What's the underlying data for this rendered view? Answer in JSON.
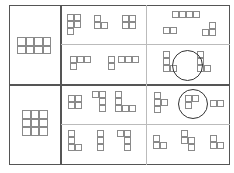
{
  "diagram": {
    "cell_size": 7,
    "colors": {
      "frame": "#555555",
      "divider": "#bbbbbb",
      "cell_border": "#8a8a8a",
      "circle": "#333333"
    },
    "rows": [
      {
        "reference": {
          "cols": 4,
          "rows": 2,
          "x": 17,
          "y": 37,
          "cell": 8.5
        },
        "groups": [
          {
            "name": "group-1a",
            "pieces": [
              {
                "x": 67,
                "y": 14,
                "cells": [
                  [
                    0,
                    0
                  ],
                  [
                    1,
                    0
                  ],
                  [
                    0,
                    1
                  ],
                  [
                    1,
                    1
                  ],
                  [
                    0,
                    2
                  ]
                ]
              },
              {
                "x": 94,
                "y": 15,
                "cells": [
                  [
                    0,
                    0
                  ],
                  [
                    0,
                    1
                  ],
                  [
                    1,
                    1
                  ]
                ]
              },
              {
                "x": 122,
                "y": 15,
                "cells": [
                  [
                    0,
                    0
                  ],
                  [
                    1,
                    0
                  ],
                  [
                    0,
                    1
                  ],
                  [
                    1,
                    1
                  ]
                ]
              }
            ]
          },
          {
            "name": "group-1b",
            "pieces": [
              {
                "x": 172,
                "y": 11,
                "cells": [
                  [
                    0,
                    0
                  ],
                  [
                    1,
                    0
                  ],
                  [
                    2,
                    0
                  ],
                  [
                    3,
                    0
                  ]
                ]
              },
              {
                "x": 163,
                "y": 27,
                "cells": [
                  [
                    0,
                    0
                  ],
                  [
                    1,
                    0
                  ]
                ]
              },
              {
                "x": 202,
                "y": 22,
                "cells": [
                  [
                    1,
                    0
                  ],
                  [
                    0,
                    1
                  ],
                  [
                    1,
                    1
                  ]
                ]
              }
            ]
          },
          {
            "name": "group-2a",
            "pieces": [
              {
                "x": 70,
                "y": 56,
                "cells": [
                  [
                    0,
                    0
                  ],
                  [
                    1,
                    0
                  ],
                  [
                    2,
                    0
                  ],
                  [
                    0,
                    1
                  ]
                ]
              },
              {
                "x": 108,
                "y": 56,
                "cells": [
                  [
                    0,
                    0
                  ],
                  [
                    0,
                    1
                  ]
                ]
              },
              {
                "x": 118,
                "y": 56,
                "cells": [
                  [
                    0,
                    0
                  ],
                  [
                    1,
                    0
                  ],
                  [
                    2,
                    0
                  ]
                ]
              }
            ]
          },
          {
            "name": "group-2b",
            "circled": true,
            "circle": {
              "x": 172,
              "y": 50,
              "d": 31
            },
            "pieces": [
              {
                "x": 163,
                "y": 51,
                "cells": [
                  [
                    0,
                    0
                  ],
                  [
                    0,
                    1
                  ],
                  [
                    0,
                    2
                  ],
                  [
                    1,
                    2
                  ]
                ]
              },
              {
                "x": 197,
                "y": 51,
                "cells": [
                  [
                    0,
                    0
                  ],
                  [
                    0,
                    1
                  ],
                  [
                    0,
                    2
                  ],
                  [
                    1,
                    2
                  ]
                ]
              }
            ]
          }
        ]
      },
      {
        "reference": {
          "cols": 3,
          "rows": 3,
          "x": 22,
          "y": 110,
          "cell": 8.5
        },
        "groups": [
          {
            "name": "group-3a",
            "pieces": [
              {
                "x": 68,
                "y": 95,
                "cells": [
                  [
                    0,
                    0
                  ],
                  [
                    1,
                    0
                  ],
                  [
                    0,
                    1
                  ],
                  [
                    1,
                    1
                  ]
                ]
              },
              {
                "x": 92,
                "y": 91,
                "cells": [
                  [
                    0,
                    0
                  ],
                  [
                    1,
                    0
                  ],
                  [
                    1,
                    1
                  ],
                  [
                    1,
                    2
                  ]
                ]
              },
              {
                "x": 115,
                "y": 91,
                "cells": [
                  [
                    0,
                    0
                  ],
                  [
                    0,
                    1
                  ],
                  [
                    0,
                    2
                  ],
                  [
                    1,
                    2
                  ],
                  [
                    2,
                    2
                  ]
                ]
              }
            ]
          },
          {
            "name": "group-3b",
            "circled": true,
            "circle": {
              "x": 178,
              "y": 89,
              "d": 30
            },
            "pieces": [
              {
                "x": 154,
                "y": 92,
                "cells": [
                  [
                    0,
                    0
                  ],
                  [
                    0,
                    1
                  ],
                  [
                    1,
                    1
                  ],
                  [
                    0,
                    2
                  ]
                ]
              },
              {
                "x": 185,
                "y": 95,
                "cells": [
                  [
                    0,
                    0
                  ],
                  [
                    1,
                    0
                  ],
                  [
                    0,
                    1
                  ]
                ]
              },
              {
                "x": 210,
                "y": 100,
                "cells": [
                  [
                    0,
                    0
                  ],
                  [
                    1,
                    0
                  ]
                ]
              }
            ]
          },
          {
            "name": "group-4a",
            "pieces": [
              {
                "x": 68,
                "y": 130,
                "cells": [
                  [
                    0,
                    0
                  ],
                  [
                    0,
                    1
                  ],
                  [
                    0,
                    2
                  ],
                  [
                    1,
                    2
                  ]
                ]
              },
              {
                "x": 97,
                "y": 130,
                "cells": [
                  [
                    0,
                    0
                  ],
                  [
                    0,
                    1
                  ],
                  [
                    0,
                    2
                  ]
                ]
              },
              {
                "x": 117,
                "y": 130,
                "cells": [
                  [
                    0,
                    0
                  ],
                  [
                    1,
                    0
                  ],
                  [
                    1,
                    1
                  ],
                  [
                    1,
                    2
                  ]
                ]
              }
            ]
          },
          {
            "name": "group-4b",
            "pieces": [
              {
                "x": 153,
                "y": 135,
                "cells": [
                  [
                    0,
                    0
                  ],
                  [
                    0,
                    1
                  ],
                  [
                    1,
                    1
                  ]
                ]
              },
              {
                "x": 181,
                "y": 130,
                "cells": [
                  [
                    0,
                    0
                  ],
                  [
                    0,
                    1
                  ],
                  [
                    1,
                    1
                  ],
                  [
                    1,
                    2
                  ]
                ]
              },
              {
                "x": 210,
                "y": 135,
                "cells": [
                  [
                    0,
                    0
                  ],
                  [
                    0,
                    1
                  ],
                  [
                    1,
                    1
                  ]
                ]
              }
            ]
          }
        ]
      }
    ]
  }
}
